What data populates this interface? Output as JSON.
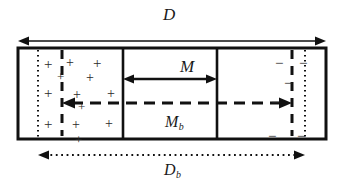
{
  "figure": {
    "kind": "schematic-diagram",
    "background_color": "#ffffff",
    "stroke_color": "#111111",
    "labels": {
      "total_width": "D",
      "middle_region": "M",
      "middle_region_sub": "M",
      "middle_region_sub_script": "b",
      "bottom_width": "D",
      "bottom_width_script": "b"
    },
    "regions": [
      {
        "name": "left-region",
        "charge_sign": "+",
        "charge_count": 11
      },
      {
        "name": "middle-region",
        "charge_sign": "",
        "charge_count": 0
      },
      {
        "name": "right-region",
        "charge_sign": "−",
        "charge_count": 6
      }
    ],
    "charges_positive": [
      {
        "x": 44,
        "y": 57,
        "size": 11
      },
      {
        "x": 66,
        "y": 56,
        "size": 10
      },
      {
        "x": 93,
        "y": 56,
        "size": 11
      },
      {
        "x": 57,
        "y": 70,
        "size": 9
      },
      {
        "x": 86,
        "y": 71,
        "size": 10
      },
      {
        "x": 44,
        "y": 86,
        "size": 11
      },
      {
        "x": 73,
        "y": 88,
        "size": 10
      },
      {
        "x": 107,
        "y": 87,
        "size": 10
      },
      {
        "x": 44,
        "y": 117,
        "size": 11
      },
      {
        "x": 72,
        "y": 118,
        "size": 10
      },
      {
        "x": 105,
        "y": 117,
        "size": 10
      },
      {
        "x": 75,
        "y": 133,
        "size": 9
      },
      {
        "x": 78,
        "y": 100,
        "size": 9
      }
    ],
    "charges_negative": [
      {
        "x": 275,
        "y": 56,
        "size": 11
      },
      {
        "x": 299,
        "y": 56,
        "size": 11
      },
      {
        "x": 284,
        "y": 76,
        "size": 11
      },
      {
        "x": 271,
        "y": 95,
        "size": 11
      },
      {
        "x": 268,
        "y": 129,
        "size": 11
      },
      {
        "x": 297,
        "y": 129,
        "size": 11
      }
    ],
    "arrows": {
      "top_D": {
        "x1": 18,
        "x2": 326,
        "y": 41,
        "style": "solid",
        "heads": "both"
      },
      "middle_M": {
        "x1": 123,
        "x2": 217,
        "y": 79,
        "style": "solid",
        "heads": "both"
      },
      "inner_dashed": {
        "x1": 62,
        "x2": 292,
        "y": 103,
        "style": "dashed",
        "heads": "both"
      },
      "bottom_Db": {
        "x1": 38,
        "x2": 305,
        "y": 155,
        "style": "dotted",
        "heads": "both"
      }
    },
    "box": {
      "x": 18,
      "y": 48,
      "width": 308,
      "height": 91
    },
    "dividers_solid": [
      123,
      217
    ],
    "dividers_dashed": [
      62,
      292
    ],
    "dividers_dotted": [
      38,
      305
    ]
  }
}
